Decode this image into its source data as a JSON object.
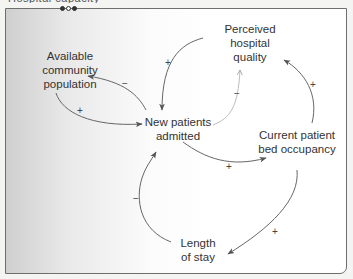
{
  "header": {
    "partial_caption": "Hospital capacity"
  },
  "pagination_dots": [
    {
      "state": "filled"
    },
    {
      "state": "hollow"
    },
    {
      "state": "filled"
    }
  ],
  "diagram": {
    "type": "causal-loop",
    "nodes": [
      {
        "id": "available",
        "label_lines": [
          "Available",
          "community",
          "population"
        ]
      },
      {
        "id": "perceived",
        "label_lines": [
          "Perceived",
          "hospital",
          "quality"
        ]
      },
      {
        "id": "new",
        "label_lines": [
          "New patients",
          "admitted"
        ]
      },
      {
        "id": "occupancy",
        "label_lines": [
          "Current patient",
          "bed occupancy"
        ]
      },
      {
        "id": "stay",
        "label_lines": [
          "Length",
          "of stay"
        ]
      }
    ],
    "links": [
      {
        "from": "new",
        "to": "available",
        "polarity": "−"
      },
      {
        "from": "available",
        "to": "new",
        "polarity": "+"
      },
      {
        "from": "perceived",
        "to": "new",
        "polarity": "+"
      },
      {
        "from": "new",
        "to": "perceived",
        "polarity": "−",
        "style": "faint"
      },
      {
        "from": "occupancy",
        "to": "perceived",
        "polarity": "+"
      },
      {
        "from": "new",
        "to": "occupancy",
        "polarity": "+"
      },
      {
        "from": "occupancy",
        "to": "stay",
        "polarity": "+"
      },
      {
        "from": "stay",
        "to": "new",
        "polarity": "−"
      }
    ]
  }
}
